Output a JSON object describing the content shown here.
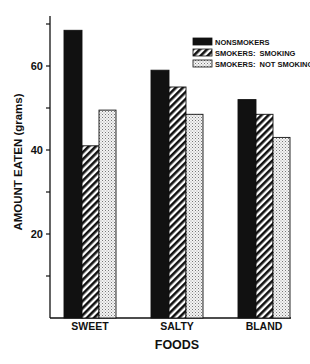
{
  "chart_data": {
    "type": "bar",
    "title": "",
    "xlabel": "FOODS",
    "ylabel": "AMOUNT EATEN (grams)",
    "categories": [
      "SWEET",
      "SALTY",
      "BLAND"
    ],
    "series": [
      {
        "name": "NONSMOKERS",
        "pattern": "solid",
        "values": [
          68.5,
          59,
          52
        ]
      },
      {
        "name": "SMOKERS:  SMOKING",
        "pattern": "hatched",
        "values": [
          41,
          55,
          48.5
        ]
      },
      {
        "name": "SMOKERS:  NOT SMOKING",
        "pattern": "dotted",
        "values": [
          49.5,
          48.5,
          43
        ]
      }
    ],
    "yticks": [
      10,
      20,
      30,
      40,
      50,
      60,
      70
    ],
    "ytick_labels": [
      "20",
      "40",
      "60"
    ],
    "ylim": [
      0,
      72
    ],
    "grid": false,
    "legend_position": "upper right"
  },
  "colors": {
    "ink": "#111111",
    "background": "#ffffff"
  }
}
